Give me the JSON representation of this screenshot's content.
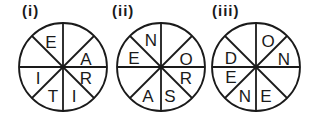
{
  "puzzles": [
    {
      "label": "(i)",
      "cx": 63,
      "cy": 67,
      "letters": [
        {
          "sector": "top-left-upper",
          "char": "E"
        },
        {
          "sector": "right-upper",
          "char": "A"
        },
        {
          "sector": "right-lower",
          "char": "R"
        },
        {
          "sector": "bottom-right",
          "char": "I"
        },
        {
          "sector": "bottom-left",
          "char": "T"
        },
        {
          "sector": "left-lower",
          "char": "I"
        }
      ]
    },
    {
      "label": "(ii)",
      "cx": 161,
      "cy": 67,
      "letters": [
        {
          "sector": "top-left-upper",
          "char": "N"
        },
        {
          "sector": "left-upper",
          "char": "E"
        },
        {
          "sector": "right-upper",
          "char": "O"
        },
        {
          "sector": "right-lower",
          "char": "R"
        },
        {
          "sector": "bottom-right",
          "char": "S"
        },
        {
          "sector": "bottom-left",
          "char": "A"
        }
      ]
    },
    {
      "label": "(iii)",
      "cx": 256,
      "cy": 67,
      "letters": [
        {
          "sector": "top-right",
          "char": "O"
        },
        {
          "sector": "right-upper",
          "char": "N"
        },
        {
          "sector": "left-upper",
          "char": "D"
        },
        {
          "sector": "left-lower",
          "char": "E"
        },
        {
          "sector": "bottom-left",
          "char": "N"
        },
        {
          "sector": "bottom-right",
          "char": "E"
        }
      ]
    }
  ]
}
